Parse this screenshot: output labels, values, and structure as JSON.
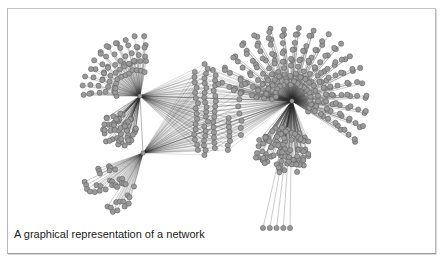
{
  "figure": {
    "caption": "A graphical representation of a network",
    "colors": {
      "background": "#ffffff",
      "frame": "#b0b0b0",
      "edge": "#2a2a2a",
      "node_fill": "#9a9a9a",
      "node_stroke": "#555555",
      "caption_text": "#1a1a1a"
    },
    "node_radius": 2.6,
    "hubs": [
      {
        "id": "hub-left-upper",
        "x": 140,
        "y": 96
      },
      {
        "id": "hub-left-lower",
        "x": 143,
        "y": 153
      },
      {
        "id": "hub-right",
        "x": 292,
        "y": 101
      }
    ],
    "hub_links": [
      [
        "hub-left-upper",
        "hub-left-lower"
      ],
      [
        "hub-left-upper",
        "hub-right"
      ],
      [
        "hub-left-lower",
        "hub-right"
      ]
    ],
    "clusters": [
      {
        "id": "fan-upper-left",
        "hub": "hub-left-upper",
        "shape": "fan",
        "count": 70,
        "angle_start": 180,
        "angle_end": 282,
        "r_min": 22,
        "r_max": 62,
        "rings": 5
      },
      {
        "id": "blob-left",
        "hub": "hub-left-upper",
        "shape": "blob",
        "count": 55,
        "cx": 118,
        "cy": 130,
        "rx": 18,
        "ry": 17
      },
      {
        "id": "fan-lower-left",
        "hub": "hub-left-lower",
        "shape": "fan",
        "count": 38,
        "angle_start": 105,
        "angle_end": 162,
        "r_min": 30,
        "r_max": 70,
        "rings": 4
      },
      {
        "id": "middle-columns",
        "hubs": [
          "hub-left-upper",
          "hub-left-lower",
          "hub-right"
        ],
        "shape": "columns",
        "columns": [
          {
            "x": 196,
            "y0": 72,
            "y1": 150,
            "n": 16
          },
          {
            "x": 206,
            "y0": 64,
            "y1": 155,
            "n": 20
          },
          {
            "x": 214,
            "y0": 70,
            "y1": 148,
            "n": 16
          },
          {
            "x": 228,
            "y0": 118,
            "y1": 150,
            "n": 8
          },
          {
            "x": 240,
            "y0": 85,
            "y1": 135,
            "n": 8
          }
        ]
      },
      {
        "id": "sphere-right",
        "hub": "hub-right",
        "shape": "fan",
        "count": 230,
        "angle_start": 185,
        "angle_end": 395,
        "r_min": 14,
        "r_max": 78,
        "rings": 8
      },
      {
        "id": "blob-right-lower",
        "hub": "hub-right",
        "shape": "blob",
        "count": 95,
        "cx": 283,
        "cy": 152,
        "rx": 28,
        "ry": 25
      },
      {
        "id": "tail-bottom",
        "hub": "hub-right",
        "shape": "row",
        "count": 5,
        "x0": 263,
        "x1": 290,
        "y": 228
      }
    ]
  }
}
